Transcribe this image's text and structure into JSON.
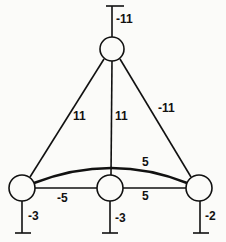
{
  "diagram": {
    "type": "weighted-graph",
    "nodes": [
      {
        "id": "top",
        "cx": 112,
        "cy": 49,
        "r": 12
      },
      {
        "id": "left",
        "cx": 22,
        "cy": 188,
        "r": 13
      },
      {
        "id": "middle",
        "cx": 110,
        "cy": 188,
        "r": 13
      },
      {
        "id": "right",
        "cx": 199,
        "cy": 188,
        "r": 13
      }
    ],
    "terminals": [
      {
        "node": "top",
        "label": "-11"
      },
      {
        "node": "left",
        "label": "-3"
      },
      {
        "node": "middle",
        "label": "-3"
      },
      {
        "node": "right",
        "label": "-2"
      }
    ],
    "edges": [
      {
        "from": "top",
        "to": "left",
        "label": "11"
      },
      {
        "from": "top",
        "to": "middle",
        "label": "11"
      },
      {
        "from": "top",
        "to": "right",
        "label": "-11"
      },
      {
        "from": "left",
        "to": "right",
        "label": "5",
        "style": "arc"
      },
      {
        "from": "left",
        "to": "middle",
        "label": "-5"
      },
      {
        "from": "middle",
        "to": "right",
        "label": "5"
      }
    ],
    "stroke_color": "#111111",
    "background_color": "#fbfbf9"
  }
}
